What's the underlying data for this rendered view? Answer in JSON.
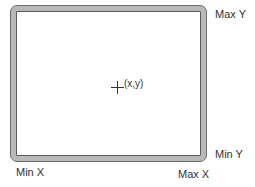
{
  "diagram": {
    "type": "coordinate-bounds",
    "point_label": "(x,y)",
    "corner_labels": {
      "max_y": "Max Y",
      "min_y": "Min Y",
      "min_x": "Min X",
      "max_x": "Max X"
    },
    "colors": {
      "frame": "#b9b9b9",
      "frame_edge": "#5a5a5a",
      "text": "#333333",
      "background": "#ffffff"
    }
  }
}
